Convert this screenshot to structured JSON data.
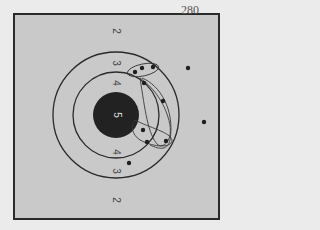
{
  "target": {
    "shot_count_label": "280",
    "ring_labels": {
      "outer_top": "2",
      "ring3_top": "3",
      "ring4_top": "4",
      "bull": "5",
      "ring4_bottom": "4",
      "ring3_bottom": "3",
      "outer_bottom": "2"
    },
    "colors": {
      "paper": "#c9c9c9",
      "background": "#ebebeb",
      "bull": "#222222",
      "lines": "#2a2a2a"
    },
    "shots": [
      {
        "x": 135,
        "y": 72
      },
      {
        "x": 142,
        "y": 68
      },
      {
        "x": 153,
        "y": 67
      },
      {
        "x": 144,
        "y": 83
      },
      {
        "x": 163,
        "y": 101
      },
      {
        "x": 188,
        "y": 68
      },
      {
        "x": 204,
        "y": 122
      },
      {
        "x": 143,
        "y": 130
      },
      {
        "x": 147,
        "y": 142
      },
      {
        "x": 166,
        "y": 141
      },
      {
        "x": 129,
        "y": 163
      }
    ]
  }
}
